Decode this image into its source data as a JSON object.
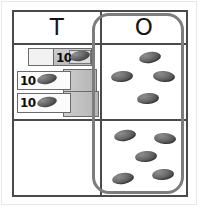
{
  "worksheet": {
    "type": "place-value-chart",
    "title": "",
    "columns": [
      {
        "key": "tens",
        "header": "T",
        "header_name": "tens-column-header"
      },
      {
        "key": "ones",
        "header": "O",
        "header_name": "ones-column-header"
      }
    ],
    "tens": {
      "block_label": "10",
      "blocks": [
        {
          "index": 1,
          "label": "10",
          "position": "top"
        },
        {
          "index": 2,
          "label": "10",
          "position": "middle"
        },
        {
          "index": 3,
          "label": "10",
          "position": "bottom"
        }
      ],
      "block_count": 3,
      "value": 30,
      "bottom_cell_blocks": [],
      "bottom_cell_count": 0
    },
    "ones": {
      "top_group_count": 4,
      "bottom_group_count": 5,
      "total_count": 9,
      "top_group_dots": [
        {
          "x": 37,
          "y": 7
        },
        {
          "x": 9,
          "y": 26
        },
        {
          "x": 51,
          "y": 26
        },
        {
          "x": 35,
          "y": 48
        }
      ],
      "bottom_group_dots": [
        {
          "x": 12,
          "y": 9
        },
        {
          "x": 52,
          "y": 12
        },
        {
          "x": 33,
          "y": 30
        },
        {
          "x": 10,
          "y": 52
        },
        {
          "x": 50,
          "y": 48
        }
      ]
    },
    "represented_number": 39
  },
  "colors": {
    "grid_line": "#4a4a4a",
    "card_outline": "#7d7d7d",
    "dot_fill": "#5a5a5a",
    "block_face": "#fbfbfb",
    "block_shade": "#c3c3c3",
    "text": "#141414",
    "page_frame": "#e8e8e8",
    "background": "#ffffff"
  }
}
